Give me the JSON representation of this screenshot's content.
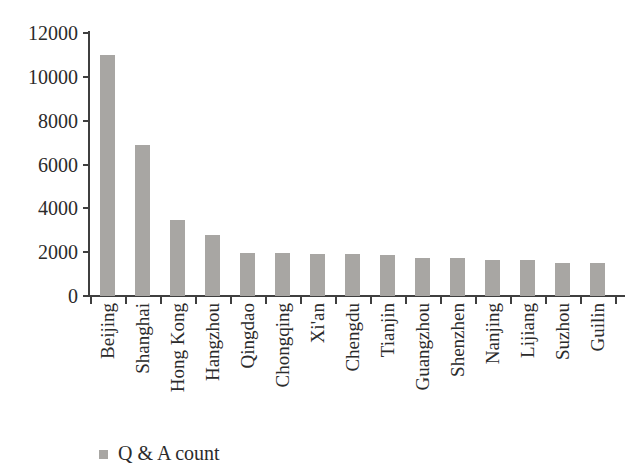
{
  "chart_data": {
    "type": "bar",
    "title": "",
    "categories": [
      "Beijing",
      "Shanghai",
      "Hong Kong",
      "Hangzhou",
      "Qingdao",
      "Chongqing",
      "Xi'an",
      "Chengdu",
      "Tianjin",
      "Guangzhou",
      "Shenzhen",
      "Nanjing",
      "Lijiang",
      "Suzhou",
      "Guilin"
    ],
    "series": [
      {
        "name": "Q & A count",
        "values": [
          11000,
          6900,
          3450,
          2800,
          1950,
          1950,
          1930,
          1900,
          1870,
          1730,
          1720,
          1650,
          1640,
          1520,
          1500
        ]
      }
    ],
    "xlabel": "",
    "ylabel": "",
    "ylim": [
      0,
      12000
    ],
    "ytick_step": 2000,
    "ytick_labels": [
      "0",
      "2000",
      "4000",
      "6000",
      "8000",
      "10000",
      "12000"
    ],
    "grid": false,
    "legend_position": "bottom-left",
    "colors": {
      "bar_fill": "#a8a6a3",
      "axis": "#3f3f3f",
      "text": "#2b2b2b",
      "background": "#ffffff"
    }
  }
}
